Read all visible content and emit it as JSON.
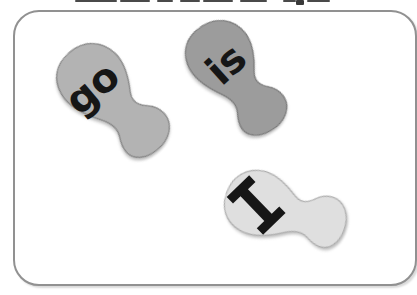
{
  "scene_label": "sight-word footprints",
  "frame": {
    "border_color": "#919191",
    "background": "#ffffff"
  },
  "footprints": [
    {
      "word": "go",
      "fill": "#b3b3b3",
      "stroke": "#858585",
      "text_color": "#161616"
    },
    {
      "word": "is",
      "fill": "#9c9c9c",
      "stroke": "#787878",
      "text_color": "#161616"
    },
    {
      "word": "I",
      "fill": "#dfdfdf",
      "stroke": "#adadad",
      "text_color": "#161616"
    }
  ]
}
